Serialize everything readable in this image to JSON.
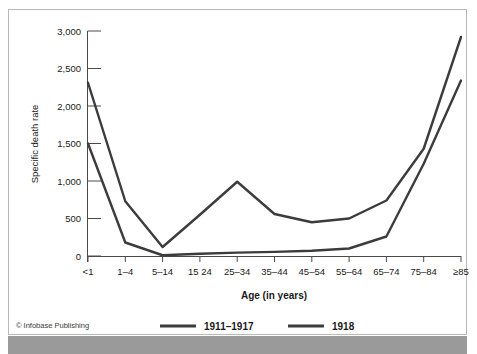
{
  "figure": {
    "credit": "© Infobase Publishing",
    "background_color": "#ffffff",
    "frame_color": "#b9b9b9",
    "line_color": "#3c3c3c"
  },
  "chart_data": {
    "type": "line",
    "title": "",
    "xlabel": "Age (in years)",
    "ylabel": "Specific death rate",
    "categories": [
      "<1",
      "1–4",
      "5–14",
      "15–24",
      "25–34",
      "35–44",
      "45–54",
      "55–64",
      "65–74",
      "75–84",
      "≥85"
    ],
    "xtick_labels": [
      "<1",
      "1–4",
      "5–14",
      "15 24",
      "25–34",
      "35–44",
      "45–54",
      "55–64",
      "65–74",
      "75–84",
      "≥85"
    ],
    "ytick_labels": [
      "0",
      "500",
      "1,000",
      "1,500",
      "2,000",
      "2,500",
      "3,000"
    ],
    "ytick_values": [
      0,
      500,
      1000,
      1500,
      2000,
      2500,
      3000
    ],
    "ylim": [
      0,
      3000
    ],
    "grid": false,
    "legend_position": "bottom",
    "series": [
      {
        "name": "1911–1917",
        "values": [
          1500,
          180,
          10,
          30,
          45,
          55,
          70,
          100,
          260,
          1230,
          2340
        ]
      },
      {
        "name": "1918",
        "values": [
          2310,
          730,
          120,
          550,
          990,
          560,
          450,
          500,
          740,
          1430,
          2920
        ]
      }
    ]
  }
}
